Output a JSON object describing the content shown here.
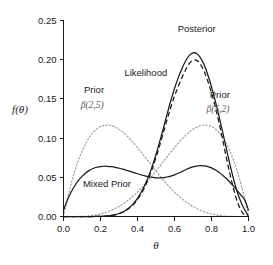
{
  "chart_data": {
    "type": "line",
    "title": "",
    "xlabel": "θ",
    "ylabel": "f(θ)",
    "xlim": [
      0.0,
      1.0
    ],
    "ylim": [
      0.0,
      0.25
    ],
    "grid": false,
    "legend_position": "inline-annotations",
    "xticks": [
      "0.0",
      "0.2",
      "0.4",
      "0.6",
      "0.8",
      "1.0"
    ],
    "xtick_values": [
      0.0,
      0.2,
      0.4,
      0.6,
      0.8,
      1.0
    ],
    "yticks": [
      "0.00",
      "0.05",
      "0.10",
      "0.15",
      "0.20",
      "0.25"
    ],
    "ytick_values": [
      0.0,
      0.05,
      0.1,
      0.15,
      0.2,
      0.25
    ],
    "x": [
      0.0,
      0.02,
      0.04,
      0.06,
      0.08,
      0.1,
      0.12,
      0.14,
      0.16,
      0.18,
      0.2,
      0.22,
      0.24,
      0.26,
      0.28,
      0.3,
      0.32,
      0.34,
      0.36,
      0.38,
      0.4,
      0.42,
      0.44,
      0.46,
      0.48,
      0.5,
      0.52,
      0.54,
      0.56,
      0.58,
      0.6,
      0.62,
      0.64,
      0.66,
      0.68,
      0.7,
      0.72,
      0.74,
      0.76,
      0.78,
      0.8,
      0.82,
      0.84,
      0.86,
      0.88,
      0.9,
      0.92,
      0.94,
      0.96,
      0.98,
      1.0
    ],
    "series": [
      {
        "name": "Prior β(2,5)",
        "style": "dotted",
        "color": "#9b9b9b",
        "peak_x": 0.2,
        "peak_y": 0.1221,
        "values": [
          0.0,
          0.0216,
          0.0406,
          0.0571,
          0.0713,
          0.0832,
          0.0931,
          0.1011,
          0.1073,
          0.1118,
          0.1147,
          0.1163,
          0.1166,
          0.1158,
          0.114,
          0.1112,
          0.1077,
          0.1035,
          0.0987,
          0.0935,
          0.0879,
          0.0821,
          0.0761,
          0.07,
          0.064,
          0.058,
          0.0522,
          0.0465,
          0.0411,
          0.036,
          0.0312,
          0.0268,
          0.0227,
          0.019,
          0.0157,
          0.0127,
          0.0102,
          0.008,
          0.0061,
          0.0045,
          0.0032,
          0.0022,
          0.0014,
          0.0008,
          0.0004,
          0.0002,
          0.0001,
          0.0,
          0.0,
          0.0,
          0.0
        ]
      },
      {
        "name": "Prior β(5,2)",
        "style": "dotted",
        "color": "#9b9b9b",
        "peak_x": 0.8,
        "peak_y": 0.1221,
        "values": [
          0.0,
          0.0,
          0.0,
          0.0,
          0.0001,
          0.0002,
          0.0004,
          0.0008,
          0.0014,
          0.0022,
          0.0032,
          0.0045,
          0.0061,
          0.008,
          0.0102,
          0.0127,
          0.0157,
          0.019,
          0.0227,
          0.0268,
          0.0312,
          0.036,
          0.0411,
          0.0465,
          0.0522,
          0.058,
          0.064,
          0.07,
          0.0761,
          0.0821,
          0.0879,
          0.0935,
          0.0987,
          0.1035,
          0.1077,
          0.1112,
          0.114,
          0.1158,
          0.1166,
          0.1163,
          0.1147,
          0.1118,
          0.1073,
          0.1011,
          0.0931,
          0.0832,
          0.0713,
          0.0571,
          0.0406,
          0.0216,
          0.0
        ]
      },
      {
        "name": "Mixed Prior",
        "style": "solid",
        "color": "#1a1a1a",
        "peak_x": 0.21,
        "peak_y": 0.062,
        "values": [
          0.008,
          0.0203,
          0.0305,
          0.0389,
          0.0457,
          0.0512,
          0.0555,
          0.0588,
          0.0612,
          0.0628,
          0.0637,
          0.0641,
          0.064,
          0.0635,
          0.0627,
          0.0616,
          0.0604,
          0.059,
          0.0575,
          0.056,
          0.0545,
          0.0531,
          0.0518,
          0.0507,
          0.0499,
          0.0494,
          0.0493,
          0.0496,
          0.0504,
          0.0516,
          0.0532,
          0.0551,
          0.0573,
          0.0596,
          0.0617,
          0.0633,
          0.0644,
          0.0648,
          0.0646,
          0.0637,
          0.062,
          0.0596,
          0.0565,
          0.0527,
          0.0484,
          0.0436,
          0.0384,
          0.0328,
          0.027,
          0.021,
          0.008
        ]
      },
      {
        "name": "Likelihood",
        "style": "dashed",
        "color": "#1a1a1a",
        "peak_x": 0.7,
        "peak_y": 0.2005,
        "values": [
          0.0,
          0.0,
          0.0,
          0.0,
          0.0,
          0.0,
          0.0,
          0.0,
          0.0,
          0.0001,
          0.0002,
          0.0004,
          0.0007,
          0.0013,
          0.0022,
          0.0035,
          0.0054,
          0.008,
          0.0115,
          0.016,
          0.0218,
          0.0291,
          0.038,
          0.0486,
          0.0611,
          0.0752,
          0.0907,
          0.107,
          0.1235,
          0.1393,
          0.1536,
          0.1656,
          0.1771,
          0.1869,
          0.1951,
          0.1994,
          0.1991,
          0.1943,
          0.1852,
          0.1727,
          0.1576,
          0.1403,
          0.1205,
          0.0985,
          0.0756,
          0.0538,
          0.0344,
          0.0186,
          0.0077,
          0.0017,
          0.0
        ]
      },
      {
        "name": "Posterior",
        "style": "solid",
        "color": "#1a1a1a",
        "peak_x": 0.705,
        "peak_y": 0.2088,
        "values": [
          0.0,
          0.0,
          0.0,
          0.0,
          0.0,
          0.0,
          0.0,
          0.0,
          0.0,
          0.0001,
          0.0002,
          0.0004,
          0.0008,
          0.0014,
          0.0024,
          0.0038,
          0.0058,
          0.0086,
          0.0123,
          0.0171,
          0.0232,
          0.0309,
          0.0402,
          0.0513,
          0.0643,
          0.0791,
          0.0955,
          0.1128,
          0.1305,
          0.1476,
          0.1633,
          0.1768,
          0.1885,
          0.1983,
          0.2055,
          0.2087,
          0.2078,
          0.2026,
          0.1934,
          0.1808,
          0.1654,
          0.1478,
          0.1284,
          0.1078,
          0.0868,
          0.0662,
          0.047,
          0.0306,
          0.0178,
          0.0082,
          0.0
        ]
      }
    ],
    "annotations": [
      {
        "name": "posterior-label",
        "text": "Posterior",
        "x": 0.72,
        "y": 0.235,
        "color": "#1a1a1a"
      },
      {
        "name": "likelihood-label",
        "text": "Likelihood",
        "x": 0.445,
        "y": 0.179,
        "color": "#8a8a8a"
      },
      {
        "name": "prior-left-label",
        "text": "Prior",
        "x": 0.165,
        "y": 0.157,
        "color": "#1a1a1a"
      },
      {
        "name": "prior-left-params",
        "text": "β(2,5)",
        "x": 0.155,
        "y": 0.139,
        "color": "#5a5a5a"
      },
      {
        "name": "prior-right-label",
        "text": "Prior",
        "x": 0.845,
        "y": 0.151,
        "color": "#1a1a1a"
      },
      {
        "name": "prior-right-params",
        "text": "β(5,2)",
        "x": 0.835,
        "y": 0.133,
        "color": "#5a5a5a"
      },
      {
        "name": "mixed-prior-label",
        "text": "Mixed Prior",
        "x": 0.235,
        "y": 0.0375,
        "color": "#1a1a1a"
      }
    ]
  }
}
